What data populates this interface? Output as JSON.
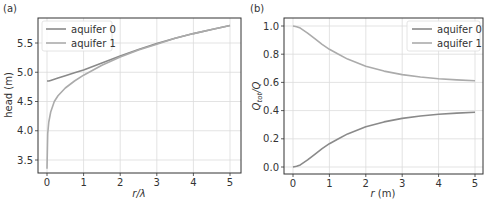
{
  "figure": {
    "panels": [
      {
        "label": "(a)"
      },
      {
        "label": "(b)"
      }
    ]
  },
  "chart_data": [
    {
      "type": "line",
      "panel": "(a)",
      "title": "",
      "xlabel": "r/λ",
      "ylabel": "head (m)",
      "xlim": [
        -0.25,
        5.25
      ],
      "ylim": [
        3.3,
        5.9
      ],
      "xticks": [
        0,
        1,
        2,
        3,
        4,
        5
      ],
      "yticks": [
        3.5,
        4.0,
        4.5,
        5.0,
        5.5
      ],
      "ytick_labels": [
        "3.5",
        "4.0",
        "4.5",
        "5.0",
        "5.5"
      ],
      "grid": true,
      "legend_position": "upper left",
      "x": [
        0,
        0.02,
        0.05,
        0.1,
        0.2,
        0.3,
        0.5,
        0.75,
        1.0,
        1.5,
        2.0,
        2.5,
        3.0,
        3.5,
        4.0,
        4.5,
        5.0
      ],
      "series": [
        {
          "name": "aquifer 0",
          "color": "#8a8a8a",
          "values": [
            4.85,
            4.85,
            4.85,
            4.86,
            4.88,
            4.9,
            4.94,
            4.99,
            5.04,
            5.16,
            5.28,
            5.39,
            5.49,
            5.58,
            5.66,
            5.73,
            5.8
          ]
        },
        {
          "name": "aquifer 1",
          "color": "#ababab",
          "values": [
            3.35,
            3.95,
            4.15,
            4.32,
            4.5,
            4.6,
            4.73,
            4.85,
            4.95,
            5.12,
            5.26,
            5.38,
            5.48,
            5.58,
            5.66,
            5.73,
            5.8
          ]
        }
      ]
    },
    {
      "type": "line",
      "panel": "(b)",
      "title": "",
      "xlabel": "r (m)",
      "ylabel": "Q_tot/Q",
      "xlim": [
        -0.25,
        5.25
      ],
      "ylim": [
        -0.05,
        1.05
      ],
      "xticks": [
        0,
        1,
        2,
        3,
        4,
        5
      ],
      "yticks": [
        0.0,
        0.2,
        0.4,
        0.6,
        0.8,
        1.0
      ],
      "ytick_labels": [
        "0.0",
        "0.2",
        "0.4",
        "0.6",
        "0.8",
        "1.0"
      ],
      "grid": true,
      "legend_position": "upper right",
      "x": [
        0,
        0.1,
        0.2,
        0.4,
        0.6,
        0.8,
        1.0,
        1.25,
        1.5,
        2.0,
        2.5,
        3.0,
        3.5,
        4.0,
        4.5,
        5.0
      ],
      "series": [
        {
          "name": "aquifer 0",
          "color": "#8a8a8a",
          "values": [
            0.0,
            0.005,
            0.015,
            0.05,
            0.09,
            0.13,
            0.165,
            0.2,
            0.235,
            0.285,
            0.32,
            0.345,
            0.362,
            0.374,
            0.382,
            0.388
          ]
        },
        {
          "name": "aquifer 1",
          "color": "#ababab",
          "values": [
            1.0,
            0.995,
            0.985,
            0.95,
            0.91,
            0.87,
            0.835,
            0.8,
            0.765,
            0.715,
            0.68,
            0.655,
            0.638,
            0.626,
            0.618,
            0.612
          ]
        }
      ]
    }
  ]
}
